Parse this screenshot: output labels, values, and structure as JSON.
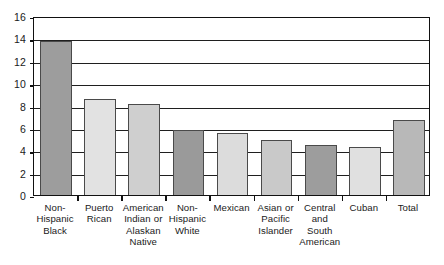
{
  "chart_data": {
    "type": "bar",
    "title": "",
    "subtitle": "",
    "xlabel": "",
    "ylabel": "",
    "ylim": [
      0,
      16
    ],
    "ytick_values": [
      0,
      2,
      4,
      6,
      8,
      10,
      12,
      14,
      16
    ],
    "ytick_labels": [
      "0",
      "2",
      "4",
      "6",
      "8",
      "10",
      "12",
      "14",
      "16"
    ],
    "grid": "horizontal",
    "legend": "none",
    "categories": [
      "Non-Hispanic Black",
      "Puerto Rican",
      "American Indian or Alaskan Native",
      "Non-Hispanic White",
      "Mexican",
      "Asian or Pacific Islander",
      "Central and South American",
      "Cuban",
      "Total"
    ],
    "category_label_lines": [
      [
        "Non-",
        "Hispanic",
        "Black"
      ],
      [
        "Puerto",
        "Rican"
      ],
      [
        "American",
        "Indian or",
        "Alaskan",
        "Native"
      ],
      [
        "Non-",
        "Hispanic",
        "White"
      ],
      [
        "Mexican"
      ],
      [
        "Asian or",
        "Pacific",
        "Islander"
      ],
      [
        "Central",
        "and",
        "South",
        "American"
      ],
      [
        "Cuban"
      ],
      [
        "Total"
      ]
    ],
    "values": [
      13.8,
      8.6,
      8.1,
      5.8,
      5.5,
      4.9,
      4.5,
      4.3,
      6.7
    ],
    "bar_colors": [
      "#9d9d9d",
      "#e2e2e2",
      "#cfcfcf",
      "#9a9a9a",
      "#dcdcdc",
      "#c9c9c9",
      "#9d9d9d",
      "#e0e0e0",
      "#b8b8b8"
    ],
    "bar_edge_color": "#4a4a4a",
    "axis_color": "#111111",
    "grid_color": "#1f1f1f",
    "background_color": "#ffffff"
  }
}
